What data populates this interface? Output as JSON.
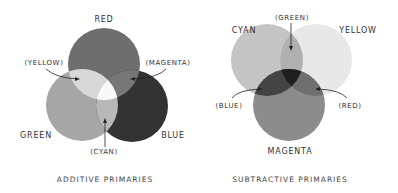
{
  "diagrams": [
    {
      "title": "ADDITIVE PRIMARIES",
      "primaries": [
        {
          "name": "RED",
          "color": "#6e6e6e"
        },
        {
          "name": "GREEN",
          "color": "#a6a6a6"
        },
        {
          "name": "BLUE",
          "color": "#333333"
        }
      ],
      "overlaps": [
        {
          "name": "(YELLOW)",
          "color": "#d8d8d8"
        },
        {
          "name": "(MAGENTA)",
          "color": "#777777"
        },
        {
          "name": "(CYAN)",
          "color": "#b8b8b8"
        },
        {
          "name": "center",
          "color": "#f8f8f8"
        }
      ]
    },
    {
      "title": "SUBTRACTIVE PRIMARIES",
      "primaries": [
        {
          "name": "CYAN",
          "color": "#c4c4c4"
        },
        {
          "name": "YELLOW",
          "color": "#e8e8e8"
        },
        {
          "name": "MAGENTA",
          "color": "#8c8c8c"
        }
      ],
      "overlaps": [
        {
          "name": "(GREEN)",
          "color": "#b0b0b0"
        },
        {
          "name": "(BLUE)",
          "color": "#444444"
        },
        {
          "name": "(RED)",
          "color": "#6f6f6f"
        },
        {
          "name": "center",
          "color": "#1e1e1e"
        }
      ]
    }
  ]
}
